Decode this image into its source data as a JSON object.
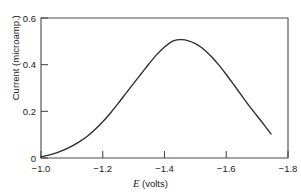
{
  "chart_data": {
    "type": "line",
    "title": "",
    "subtitle": "",
    "xlabel_italic": "E",
    "xlabel_rest": " (volts)",
    "xlabel": "E (volts)",
    "ylabel": "Current (microamp.)",
    "xlim": [
      -1.0,
      -1.8
    ],
    "ylim": [
      0,
      0.6
    ],
    "xticks": [
      -1.0,
      -1.2,
      -1.4,
      -1.6,
      -1.8
    ],
    "xtick_labels": [
      "−1.0",
      "−1.2",
      "−1.4",
      "−1.6",
      "−1.8"
    ],
    "yticks": [
      0,
      0.2,
      0.4,
      0.6
    ],
    "ytick_labels": [
      "0",
      "0.2",
      "0.4",
      "0.6"
    ],
    "grid": false,
    "legend": null,
    "series": [
      {
        "name": "polarographic wave",
        "color": "#2b2b2b",
        "x": [
          -1.0,
          -1.025,
          -1.05,
          -1.075,
          -1.1,
          -1.125,
          -1.15,
          -1.175,
          -1.2,
          -1.225,
          -1.25,
          -1.275,
          -1.3,
          -1.325,
          -1.35,
          -1.375,
          -1.4,
          -1.425,
          -1.44,
          -1.455,
          -1.475,
          -1.5,
          -1.525,
          -1.55,
          -1.575,
          -1.6,
          -1.625,
          -1.65,
          -1.675,
          -1.7,
          -1.725,
          -1.745
        ],
        "y": [
          0.005,
          0.012,
          0.022,
          0.035,
          0.051,
          0.07,
          0.093,
          0.122,
          0.155,
          0.193,
          0.234,
          0.277,
          0.32,
          0.362,
          0.404,
          0.443,
          0.476,
          0.5,
          0.506,
          0.507,
          0.503,
          0.49,
          0.468,
          0.437,
          0.4,
          0.358,
          0.313,
          0.267,
          0.222,
          0.18,
          0.138,
          0.103
        ]
      }
    ],
    "annotations": [],
    "peak": {
      "x": -1.44,
      "y": 0.506
    }
  },
  "figure": {
    "background_color": "#ffffff",
    "axis_color": "#4a4a4a",
    "curve_color": "#2b2b2b"
  }
}
